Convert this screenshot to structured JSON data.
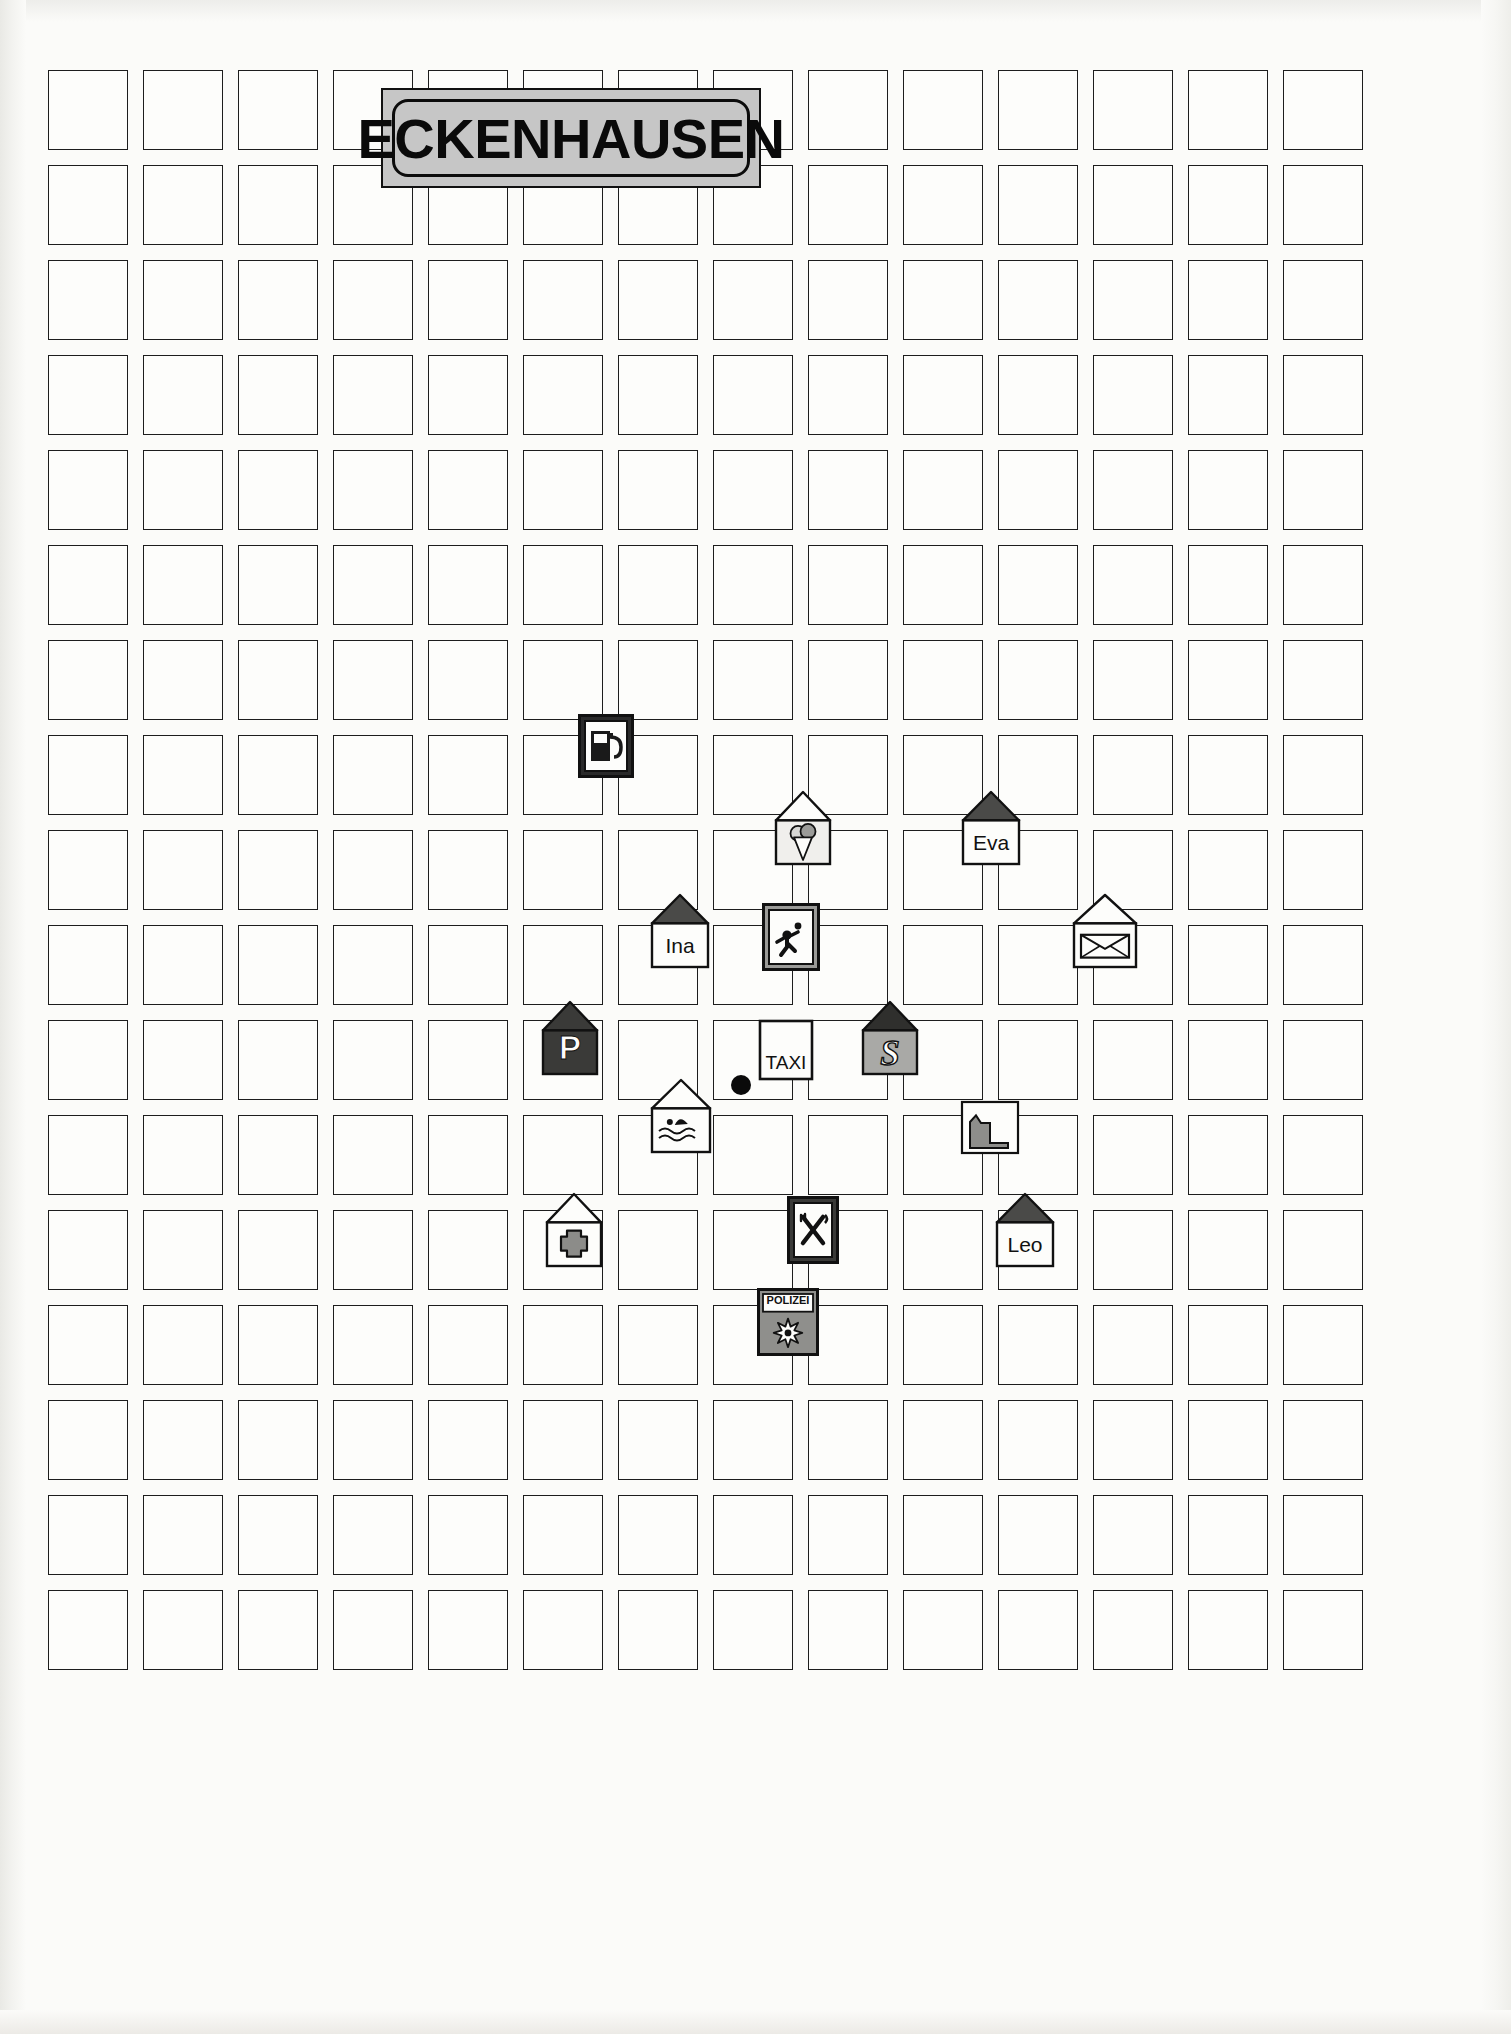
{
  "map": {
    "title": "ECKENHAUSEN",
    "type": "town-street-grid-map",
    "background_color": "#fbfbf9",
    "block_border_color": "#1d1d1d",
    "title_banner": {
      "fill_color": "#c6c6c6",
      "border_color": "#111111",
      "text_color": "#0a0a0a",
      "x": 381,
      "y": 88,
      "width": 380,
      "height": 100
    },
    "grid": {
      "columns": 14,
      "rows": 17,
      "cell_width": 80,
      "cell_height": 80,
      "gap_x": 15,
      "gap_y": 15,
      "origin_x": 48,
      "origin_y": 70
    },
    "center_dot": {
      "x": 741,
      "y": 1085,
      "diameter": 20,
      "color": "#0a0a0a"
    },
    "markers": [
      {
        "id": "gas-station",
        "name": "Tankstelle",
        "icon": "fuel-pump-icon",
        "shape": "sign",
        "label": "",
        "x": 578,
        "y": 714,
        "width": 56,
        "height": 64
      },
      {
        "id": "ice-cream-shop",
        "name": "Eisdiele",
        "icon": "ice-cream-cone-icon",
        "shape": "house",
        "label": "",
        "x": 774,
        "y": 790,
        "width": 58,
        "height": 76
      },
      {
        "id": "house-eva",
        "name": "Haus Eva",
        "icon": "house-icon",
        "shape": "house",
        "label": "Eva",
        "x": 961,
        "y": 790,
        "width": 60,
        "height": 76
      },
      {
        "id": "house-ina",
        "name": "Haus Ina",
        "icon": "house-icon",
        "shape": "house",
        "label": "Ina",
        "x": 650,
        "y": 893,
        "width": 60,
        "height": 76
      },
      {
        "id": "playground",
        "name": "Spielplatz",
        "icon": "playground-child-icon",
        "shape": "sign",
        "label": "",
        "x": 762,
        "y": 903,
        "width": 58,
        "height": 68
      },
      {
        "id": "post-office",
        "name": "Post",
        "icon": "envelope-icon",
        "shape": "house",
        "label": "",
        "x": 1072,
        "y": 893,
        "width": 66,
        "height": 76
      },
      {
        "id": "parking",
        "name": "Parkplatz",
        "icon": "letter-p-icon",
        "shape": "house",
        "label": "P",
        "x": 541,
        "y": 1000,
        "width": 58,
        "height": 76
      },
      {
        "id": "taxi-stand",
        "name": "Taxistand",
        "icon": "taxi-sign-icon",
        "shape": "sign",
        "label": "TAXI",
        "x": 758,
        "y": 1019,
        "width": 56,
        "height": 62
      },
      {
        "id": "school",
        "name": "Schule",
        "icon": "letter-s-icon",
        "shape": "house",
        "label": "S",
        "x": 861,
        "y": 1000,
        "width": 58,
        "height": 76
      },
      {
        "id": "swimming-pool",
        "name": "Schwimmbad",
        "icon": "swimmer-waves-icon",
        "shape": "house",
        "label": "",
        "x": 650,
        "y": 1078,
        "width": 62,
        "height": 76
      },
      {
        "id": "factory",
        "name": "Fabrik",
        "icon": "factory-icon",
        "shape": "building",
        "label": "",
        "x": 960,
        "y": 1100,
        "width": 60,
        "height": 55
      },
      {
        "id": "pharmacy",
        "name": "Apotheke",
        "icon": "medical-cross-icon",
        "shape": "house",
        "label": "",
        "x": 545,
        "y": 1192,
        "width": 58,
        "height": 76
      },
      {
        "id": "restaurant",
        "name": "Restaurant",
        "icon": "fork-knife-icon",
        "shape": "sign",
        "label": "",
        "x": 787,
        "y": 1196,
        "width": 52,
        "height": 68
      },
      {
        "id": "house-leo",
        "name": "Haus Leo",
        "icon": "house-icon",
        "shape": "house",
        "label": "Leo",
        "x": 995,
        "y": 1192,
        "width": 60,
        "height": 76
      },
      {
        "id": "police-station",
        "name": "Polizei",
        "icon": "police-badge-icon",
        "shape": "sign",
        "label": "POLIZEI",
        "x": 757,
        "y": 1288,
        "width": 62,
        "height": 68
      }
    ]
  }
}
